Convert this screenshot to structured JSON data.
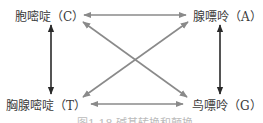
{
  "nodes": {
    "cytosine": "胞嘧啶（C）",
    "adenine": "腺嘌呤（A）",
    "thymine": "胸腺嘧啶（T）",
    "guanine": "鸟嘌呤（G）"
  },
  "edges": [
    {
      "from": "C",
      "to": "A",
      "type": "transversion",
      "color": "#8a8a8a"
    },
    {
      "from": "T",
      "to": "G",
      "type": "transversion",
      "color": "#8a8a8a"
    },
    {
      "from": "C",
      "to": "G",
      "type": "transversion",
      "color": "#8a8a8a"
    },
    {
      "from": "A",
      "to": "T",
      "type": "transversion",
      "color": "#8a8a8a"
    },
    {
      "from": "C",
      "to": "T",
      "type": "transition",
      "color": "#2a2a2a"
    },
    {
      "from": "A",
      "to": "G",
      "type": "transition",
      "color": "#2a2a2a"
    }
  ],
  "caption": "图1-18 碱基转换和颠换"
}
